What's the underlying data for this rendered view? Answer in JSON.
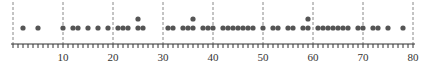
{
  "chart_data": {
    "type": "scatter",
    "subtype": "dot_plot",
    "title": "",
    "xlabel": "",
    "ylabel": "",
    "xlim": [
      0,
      80
    ],
    "major_ticks": [
      10,
      20,
      30,
      40,
      50,
      60,
      70,
      80
    ],
    "tick_labels": [
      "10",
      "20",
      "30",
      "40",
      "50",
      "60",
      "70",
      "80"
    ],
    "minor_tick_step": 1,
    "gridlines": "dashed vertical lines at each major tick",
    "values": [
      2,
      5,
      10,
      12,
      13,
      15,
      17,
      19,
      21,
      22,
      23,
      25,
      25,
      26,
      31,
      32,
      34,
      35,
      36,
      36,
      38,
      39,
      40,
      42,
      43,
      44,
      45,
      46,
      47,
      48,
      50,
      52,
      53,
      55,
      56,
      58,
      59,
      59,
      61,
      62,
      63,
      64,
      65,
      66,
      67,
      69,
      70,
      72,
      73,
      75,
      78
    ],
    "stacked_dots": [
      25,
      36,
      59
    ],
    "dot_color": "#555555",
    "grid_color": "#888888",
    "axis_color": "#333333"
  }
}
